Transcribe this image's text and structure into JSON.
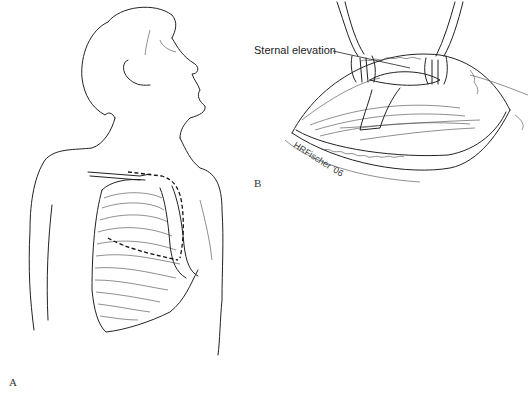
{
  "figure": {
    "panels": [
      {
        "id": "A",
        "label": "A",
        "description": "Patient torso with rib cage, dashed incision outline over sternum"
      },
      {
        "id": "B",
        "label": "B",
        "description": "Surgical field with retractors elevating sternum"
      }
    ],
    "annotations": {
      "sternal_elevation": "Sternal elevation"
    },
    "signature": "HRFischer '06",
    "colors": {
      "line": "#222222",
      "background": "#ffffff"
    }
  }
}
